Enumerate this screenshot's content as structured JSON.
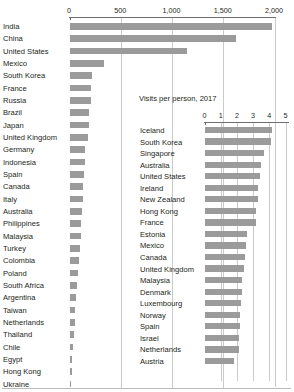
{
  "chart_data": [
    {
      "type": "bar",
      "orientation": "horizontal",
      "id": "main-chart",
      "title": "",
      "xlabel": "",
      "ylabel": "",
      "xlim": [
        0,
        2000
      ],
      "ticks": [
        "0",
        "500",
        "1,000",
        "1,500",
        "2,000"
      ],
      "tick_values": [
        0,
        500,
        1000,
        1500,
        2000
      ],
      "grid": true,
      "legend": "none",
      "bar_color": "#9b9b9b",
      "categories": [
        "India",
        "China",
        "United States",
        "Mexico",
        "South Korea",
        "France",
        "Russia",
        "Brazil",
        "Japan",
        "United Kingdom",
        "Germany",
        "Indonesia",
        "Spain",
        "Canada",
        "Italy",
        "Australia",
        "Philippines",
        "Malaysia",
        "Turkey",
        "Colombia",
        "Poland",
        "South Africa",
        "Argentina",
        "Taiwan",
        "Netherlands",
        "Thailand",
        "Chile",
        "Egypt",
        "Hong Kong",
        "Ukraine"
      ],
      "values": [
        1980,
        1620,
        1150,
        338,
        220,
        210,
        205,
        195,
        190,
        185,
        150,
        148,
        140,
        135,
        130,
        120,
        112,
        108,
        100,
        92,
        82,
        72,
        64,
        56,
        50,
        44,
        36,
        28,
        22,
        16
      ]
    },
    {
      "type": "bar",
      "orientation": "horizontal",
      "id": "inset-chart",
      "title": "Visits per person, 2017",
      "xlabel": "",
      "ylabel": "",
      "xlim": [
        0,
        5
      ],
      "ticks": [
        "0",
        "1",
        "2",
        "3",
        "4",
        "5"
      ],
      "tick_values": [
        0,
        1,
        2,
        3,
        4,
        5
      ],
      "grid": true,
      "legend": "none",
      "bar_color": "#9b9b9b",
      "categories": [
        "Iceland",
        "South Korea",
        "Singapore",
        "Australia",
        "United States",
        "Ireland",
        "New Zealand",
        "Hong Kong",
        "France",
        "Estonia",
        "Mexico",
        "Canada",
        "United Kingdom",
        "Malaysia",
        "Denmark",
        "Luxembourg",
        "Norway",
        "Spain",
        "Israel",
        "Netherlands",
        "Austria"
      ],
      "values": [
        4.15,
        4.1,
        3.65,
        3.5,
        3.4,
        3.3,
        3.3,
        3.2,
        3.15,
        2.6,
        2.55,
        2.5,
        2.45,
        2.3,
        2.3,
        2.25,
        2.2,
        2.2,
        2.15,
        2.1,
        1.85
      ]
    }
  ],
  "main": {
    "ticks": [
      "0",
      "500",
      "1,000",
      "1,500",
      "2,000"
    ],
    "rows": [
      {
        "label": "India",
        "value": 1980
      },
      {
        "label": "China",
        "value": 1620
      },
      {
        "label": "United States",
        "value": 1150
      },
      {
        "label": "Mexico",
        "value": 338
      },
      {
        "label": "South Korea",
        "value": 220
      },
      {
        "label": "France",
        "value": 210
      },
      {
        "label": "Russia",
        "value": 205
      },
      {
        "label": "Brazil",
        "value": 195
      },
      {
        "label": "Japan",
        "value": 190
      },
      {
        "label": "United Kingdom",
        "value": 185
      },
      {
        "label": "Germany",
        "value": 150
      },
      {
        "label": "Indonesia",
        "value": 148
      },
      {
        "label": "Spain",
        "value": 140
      },
      {
        "label": "Canada",
        "value": 135
      },
      {
        "label": "Italy",
        "value": 130
      },
      {
        "label": "Australia",
        "value": 120
      },
      {
        "label": "Philippines",
        "value": 112
      },
      {
        "label": "Malaysia",
        "value": 108
      },
      {
        "label": "Turkey",
        "value": 100
      },
      {
        "label": "Colombia",
        "value": 92
      },
      {
        "label": "Poland",
        "value": 82
      },
      {
        "label": "South Africa",
        "value": 72
      },
      {
        "label": "Argentina",
        "value": 64
      },
      {
        "label": "Taiwan",
        "value": 56
      },
      {
        "label": "Netherlands",
        "value": 50
      },
      {
        "label": "Thailand",
        "value": 44
      },
      {
        "label": "Chile",
        "value": 36
      },
      {
        "label": "Egypt",
        "value": 28
      },
      {
        "label": "Hong Kong",
        "value": 22
      },
      {
        "label": "Ukraine",
        "value": 16
      }
    ]
  },
  "inset": {
    "title": "Visits per person, 2017",
    "ticks": [
      "0",
      "1",
      "2",
      "3",
      "4",
      "5"
    ],
    "rows": [
      {
        "label": "Iceland",
        "value": 4.15
      },
      {
        "label": "South Korea",
        "value": 4.1
      },
      {
        "label": "Singapore",
        "value": 3.65
      },
      {
        "label": "Australia",
        "value": 3.5
      },
      {
        "label": "United States",
        "value": 3.4
      },
      {
        "label": "Ireland",
        "value": 3.3
      },
      {
        "label": "New Zealand",
        "value": 3.3
      },
      {
        "label": "Hong Kong",
        "value": 3.2
      },
      {
        "label": "France",
        "value": 3.15
      },
      {
        "label": "Estonia",
        "value": 2.6
      },
      {
        "label": "Mexico",
        "value": 2.55
      },
      {
        "label": "Canada",
        "value": 2.5
      },
      {
        "label": "United Kingdom",
        "value": 2.45
      },
      {
        "label": "Malaysia",
        "value": 2.3
      },
      {
        "label": "Denmark",
        "value": 2.3
      },
      {
        "label": "Luxembourg",
        "value": 2.25
      },
      {
        "label": "Norway",
        "value": 2.2
      },
      {
        "label": "Spain",
        "value": 2.2
      },
      {
        "label": "Israel",
        "value": 2.15
      },
      {
        "label": "Netherlands",
        "value": 2.1
      },
      {
        "label": "Austria",
        "value": 1.85
      }
    ]
  },
  "colors": {
    "bar": "#9b9b9b",
    "axis": "#6d6e71",
    "grid": "#c9cacc",
    "text": "#231f20",
    "background": "#ffffff"
  }
}
